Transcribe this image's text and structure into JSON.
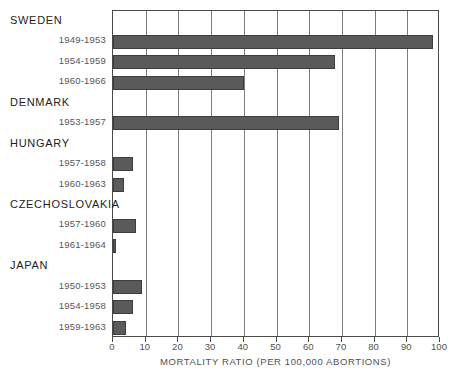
{
  "chart_data": {
    "type": "bar",
    "orientation": "horizontal",
    "title": "",
    "xlabel": "MORTALITY RATIO (PER 100,000 ABORTIONS)",
    "ylabel": "",
    "xlim": [
      0,
      100
    ],
    "xticks": [
      0,
      10,
      20,
      30,
      40,
      50,
      60,
      70,
      80,
      90,
      100
    ],
    "xtick_labels": [
      "0",
      "10",
      "20",
      "30",
      "40",
      "50",
      "60",
      "70",
      "80",
      "90",
      "100"
    ],
    "grid": true,
    "grid_axis": "x",
    "legend": "none",
    "bar_color": "#5a5a5a",
    "categories": [
      "1949-1953",
      "1954-1959",
      "1960-1966",
      "1953-1957",
      "1957-1958",
      "1960-1963",
      "1957-1960",
      "1961-1964",
      "1950-1953",
      "1954-1958",
      "1959-1963"
    ],
    "values": [
      98,
      68,
      40,
      69,
      6,
      3.5,
      7,
      1,
      9,
      6,
      4
    ],
    "groups": [
      {
        "name": "SWEDEN",
        "rows": [
          {
            "label": "1949-1953",
            "value": 98
          },
          {
            "label": "1954-1959",
            "value": 68
          },
          {
            "label": "1960-1966",
            "value": 40
          }
        ]
      },
      {
        "name": "DENMARK",
        "rows": [
          {
            "label": "1953-1957",
            "value": 69
          }
        ]
      },
      {
        "name": "HUNGARY",
        "rows": [
          {
            "label": "1957-1958",
            "value": 6
          },
          {
            "label": "1960-1963",
            "value": 3.5
          }
        ]
      },
      {
        "name": "CZECHOSLOVAKIA",
        "rows": [
          {
            "label": "1957-1960",
            "value": 7
          },
          {
            "label": "1961-1964",
            "value": 1
          }
        ]
      },
      {
        "name": "JAPAN",
        "rows": [
          {
            "label": "1950-1953",
            "value": 9
          },
          {
            "label": "1954-1958",
            "value": 6
          },
          {
            "label": "1959-1963",
            "value": 4
          }
        ]
      }
    ],
    "slots": [
      {
        "kind": "group",
        "text": "SWEDEN"
      },
      {
        "kind": "bar",
        "text": "1949-1953",
        "value": 98
      },
      {
        "kind": "bar",
        "text": "1954-1959",
        "value": 68
      },
      {
        "kind": "bar",
        "text": "1960-1966",
        "value": 40
      },
      {
        "kind": "group",
        "text": "DENMARK"
      },
      {
        "kind": "bar",
        "text": "1953-1957",
        "value": 69
      },
      {
        "kind": "group",
        "text": "HUNGARY"
      },
      {
        "kind": "bar",
        "text": "1957-1958",
        "value": 6
      },
      {
        "kind": "bar",
        "text": "1960-1963",
        "value": 3.5
      },
      {
        "kind": "group",
        "text": "CZECHOSLOVAKIA"
      },
      {
        "kind": "bar",
        "text": "1957-1960",
        "value": 7
      },
      {
        "kind": "bar",
        "text": "1961-1964",
        "value": 1
      },
      {
        "kind": "group",
        "text": "JAPAN"
      },
      {
        "kind": "bar",
        "text": "1950-1953",
        "value": 9
      },
      {
        "kind": "bar",
        "text": "1954-1958",
        "value": 6
      },
      {
        "kind": "bar",
        "text": "1959-1963",
        "value": 4
      }
    ]
  }
}
